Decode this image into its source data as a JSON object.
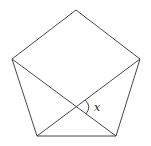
{
  "diagram": {
    "shape": "regular pentagon",
    "vertices": {
      "top": [
        76,
        10
      ],
      "left": [
        12,
        59
      ],
      "right": [
        140,
        59
      ],
      "bottom_left": [
        37,
        136
      ],
      "bottom_right": [
        116,
        136
      ]
    },
    "diagonals": [
      {
        "from": "left",
        "to": "bottom_right"
      },
      {
        "from": "right",
        "to": "bottom_left"
      }
    ],
    "angle_label": "x",
    "colors": {
      "stroke": "#333333",
      "background": "#ffffff"
    }
  }
}
